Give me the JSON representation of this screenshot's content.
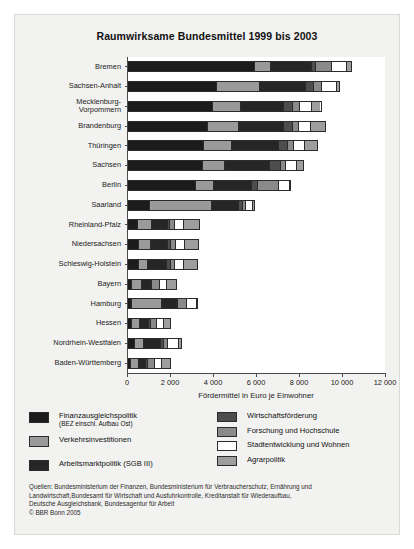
{
  "chart_data": {
    "type": "bar",
    "orientation": "horizontal",
    "stacked": true,
    "title": "Raumwirksame Bundesmittel 1999 bis 2003",
    "xlabel": "Fördermittel in Euro je Einwohner",
    "ylabel": "",
    "xlim": [
      0,
      12000
    ],
    "xticks": [
      0,
      2000,
      4000,
      6000,
      8000,
      10000,
      12000
    ],
    "xticklabels": [
      "0",
      "2 000",
      "4 000",
      "6 000",
      "8 000",
      "10 000",
      "12 000"
    ],
    "grid": false,
    "legend_position": "below-axes",
    "categories": [
      "Bremen",
      "Sachsen-Anhalt",
      "Mecklenburg-\nVorpommern",
      "Brandenburg",
      "Thüringen",
      "Sachsen",
      "Berlin",
      "Saarland",
      "Rheinland-Pfalz",
      "Niedersachsen",
      "Schleswig-Holstein",
      "Bayern",
      "Hamburg",
      "Hessen",
      "Nordrhein-Westfalen",
      "Baden-Württemberg"
    ],
    "series": [
      {
        "name": "Finanzausgleichspolitik",
        "name_sub": "(BEZ einschl. Aufbau Ost)",
        "color": "#1c1c1c",
        "values": [
          5900,
          4100,
          3950,
          3700,
          3500,
          3450,
          3150,
          1000,
          430,
          480,
          470,
          120,
          150,
          130,
          300,
          110
        ]
      },
      {
        "name": "Verkehrsinvestitionen",
        "color": "#9a9a9a",
        "values": [
          750,
          2000,
          1300,
          1450,
          1300,
          1050,
          850,
          2900,
          640,
          550,
          420,
          520,
          1400,
          400,
          420,
          360
        ]
      },
      {
        "name": "Arbeitsmarktpolitik (SGB III)",
        "color": "#262626",
        "values": [
          1900,
          2150,
          2000,
          2100,
          2200,
          2100,
          1750,
          1250,
          750,
          800,
          900,
          400,
          700,
          420,
          800,
          360
        ]
      },
      {
        "name": "Wirtschaftsförderung",
        "color": "#4d4d4d",
        "values": [
          200,
          420,
          430,
          420,
          430,
          500,
          300,
          180,
          120,
          170,
          170,
          60,
          60,
          80,
          130,
          90
        ]
      },
      {
        "name": "Forschung und Hochschule",
        "color": "#8a8a8a",
        "values": [
          750,
          330,
          310,
          300,
          270,
          260,
          950,
          180,
          230,
          230,
          200,
          370,
          420,
          300,
          200,
          330
        ]
      },
      {
        "name": "Stadtentwicklung und Wohnen",
        "color": "#ffffff",
        "values": [
          700,
          700,
          560,
          530,
          530,
          500,
          520,
          300,
          420,
          430,
          450,
          340,
          470,
          350,
          500,
          330
        ]
      },
      {
        "name": "Agrarpolitik",
        "color": "#9e9e9e",
        "values": [
          200,
          180,
          450,
          700,
          620,
          340,
          80,
          110,
          760,
          640,
          630,
          470,
          50,
          310,
          170,
          430
        ]
      }
    ],
    "totals": [
      10400,
      9880,
      9000,
      9200,
      8850,
      8200,
      7600,
      5920,
      3350,
      3300,
      3240,
      2280,
      3250,
      1990,
      2520,
      2010
    ]
  },
  "legend": {
    "left": [
      {
        "label": "Finanzausgleichspolitik",
        "sub": "(BEZ einschl. Aufbau Ost)",
        "color": "#1c1c1c"
      },
      {
        "label": "Verkehrsinvestitionen",
        "sub": "",
        "color": "#9a9a9a"
      },
      {
        "label": "Arbeitsmarktpolitik (SGB III)",
        "sub": "",
        "color": "#262626"
      }
    ],
    "right": [
      {
        "label": "Wirtschaftsförderung",
        "color": "#4d4d4d"
      },
      {
        "label": "Forschung und Hochschule",
        "color": "#8a8a8a"
      },
      {
        "label": "Stadtentwicklung und Wohnen",
        "color": "#ffffff"
      },
      {
        "label": "Agrarpolitik",
        "color": "#9e9e9e"
      }
    ]
  },
  "sources": {
    "line1": "Quellen: Bundesministerium der Finanzen, Bundesministerium für Verbraucherschutz, Ernährung und",
    "line2": "Landwirtschaft,Bundesamt für Wirtschaft und Ausfuhrkontrolle, Kreditanstalt für Wiederaufbau,",
    "line3": "Deutsche Ausgleichsbank, Bundesagentur für Arbeit",
    "line4": "© BBR Bonn 2005"
  }
}
